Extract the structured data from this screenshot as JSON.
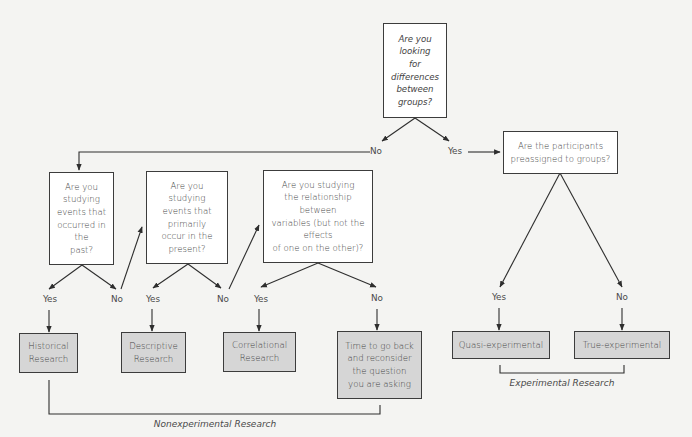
{
  "diagram": {
    "type": "flowchart",
    "colors": {
      "background": "#f4f4f2",
      "question_box": "#ffffff",
      "result_box": "#d6d6d6",
      "line": "#2e2e2e",
      "text": "#444444"
    },
    "questions": {
      "q_differences": "Are you\nlooking\nfor\ndifferences\nbetween\ngroups?",
      "q_preassigned": "Are the participants\npreassigned to groups?",
      "q_past": "Are you\nstudying\nevents that\noccurred in\nthe\npast?",
      "q_present": "Are you\nstudying\nevents that\nprimarily\noccur in the\npresent?",
      "q_relationship": "Are you studying\nthe relationship\nbetween\nvariables (but not the\neffects\nof one on the other)?"
    },
    "results": {
      "historical": "Historical\nResearch",
      "descriptive": "Descriptive\nResearch",
      "correlational": "Correlational\nResearch",
      "reconsider": "Time to go back\nand reconsider\nthe question\nyou are asking",
      "quasi": "Quasi-experimental",
      "true": "True-experimental"
    },
    "branch_labels": {
      "differences_no": "No",
      "differences_yes": "Yes",
      "past_yes": "Yes",
      "past_no": "No",
      "present_yes": "Yes",
      "present_no": "No",
      "relationship_yes": "Yes",
      "relationship_no": "No",
      "preassigned_yes": "Yes",
      "preassigned_no": "No"
    },
    "categories": {
      "nonexperimental": "Nonexperimental Research",
      "experimental": "Experimental Research"
    }
  }
}
